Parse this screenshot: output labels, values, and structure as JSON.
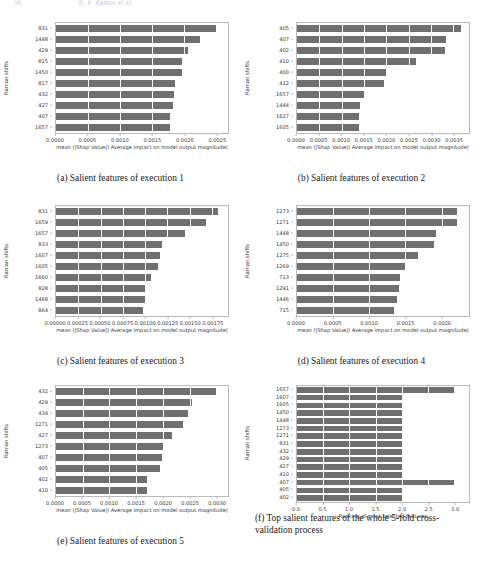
{
  "header": {
    "page_number": "56",
    "running_head": "A. F. Ramos et al."
  },
  "figure": {
    "panels": [
      {
        "id": "a",
        "caption": "(a) Salient features of execution 1",
        "ylabel": "Raman shifts",
        "xlabel": "mean (|Shap Value|) Average impact on model output magnitude)",
        "chart_data": {
          "type": "bar",
          "orientation": "horizontal",
          "title": "",
          "ylabel": "Raman shifts",
          "xlabel": "mean (|Shap Value|) Average impact on model output magnitude)",
          "categories": [
            "831",
            "1448",
            "429",
            "815",
            "1450",
            "817",
            "432",
            "427",
            "407",
            "1657"
          ],
          "values": [
            0.00249,
            0.00225,
            0.00205,
            0.00197,
            0.00196,
            0.00185,
            0.00184,
            0.00182,
            0.00178,
            0.00177
          ],
          "xlim": [
            0,
            0.00268
          ],
          "xticks": [
            0.0,
            0.0005,
            0.001,
            0.0015,
            0.002,
            0.0025
          ],
          "xticklabels": [
            "0.0000",
            "0.0005",
            "0.0010",
            "0.0015",
            "0.0020",
            "0.0025"
          ],
          "grid": true,
          "legend": null
        }
      },
      {
        "id": "b",
        "caption": "(b) Salient features of execution 2",
        "ylabel": "Raman shifts",
        "xlabel": "mean (|Shap Value|) Average impact on model output magnitude)",
        "chart_data": {
          "type": "bar",
          "orientation": "horizontal",
          "title": "",
          "ylabel": "Raman shifts",
          "xlabel": "mean (|Shap Value|) Average impact on model output magnitude)",
          "categories": [
            "405",
            "407",
            "402",
            "410",
            "400",
            "412",
            "1657",
            "1444",
            "1627",
            "1605"
          ],
          "values": [
            0.00366,
            0.00334,
            0.00331,
            0.00266,
            0.00201,
            0.00194,
            0.00152,
            0.0014,
            0.00139,
            0.00138
          ],
          "xlim": [
            0,
            0.00385
          ],
          "xticks": [
            0.0,
            0.0005,
            0.001,
            0.0015,
            0.002,
            0.0025,
            0.003,
            0.0035
          ],
          "xticklabels": [
            "0.0000",
            "0.0005",
            "0.0010",
            "0.0015",
            "0.0020",
            "0.0025",
            "0.0030",
            "0.0035"
          ],
          "grid": true,
          "legend": null
        }
      },
      {
        "id": "c",
        "caption": "(c) Salient features of execution 3",
        "ylabel": "Raman shifts",
        "xlabel": "mean (|Shap Value|) Average impact on model output magnitude)",
        "chart_data": {
          "type": "bar",
          "orientation": "horizontal",
          "title": "",
          "ylabel": "Raman shifts",
          "xlabel": "mean (|Shap Value|) Average impact on model output magnitude)",
          "categories": [
            "831",
            "1659",
            "1657",
            "833",
            "1607",
            "1605",
            "1660",
            "828",
            "1468",
            "864"
          ],
          "values": [
            0.00182,
            0.00168,
            0.00145,
            0.00119,
            0.00117,
            0.00114,
            0.00107,
            0.00101,
            0.001,
            0.00098
          ],
          "xlim": [
            0,
            0.00193
          ],
          "xticks": [
            0.0,
            0.00025,
            0.0005,
            0.00075,
            0.001,
            0.00125,
            0.0015,
            0.00175
          ],
          "xticklabels": [
            "0.00000",
            "0.00025",
            "0.00050",
            "0.00075",
            "0.00100",
            "0.00125",
            "0.00150",
            "0.00175"
          ],
          "grid": true,
          "legend": null
        }
      },
      {
        "id": "d",
        "caption": "(d) Salient features of execution 4",
        "ylabel": "Raman shifts",
        "xlabel": "mean (|Shap Value|) Average impact on model output magnitude)",
        "chart_data": {
          "type": "bar",
          "orientation": "horizontal",
          "title": "",
          "ylabel": "Raman shifts",
          "xlabel": "mean (|Shap Value|) Average impact on model output magnitude)",
          "categories": [
            "1273",
            "1271",
            "1448",
            "1450",
            "1275",
            "1269",
            "713",
            "1291",
            "1446",
            "715"
          ],
          "values": [
            0.00222,
            0.00221,
            0.00193,
            0.0019,
            0.00168,
            0.0015,
            0.00142,
            0.00141,
            0.00139,
            0.00134
          ],
          "xlim": [
            0,
            0.00238
          ],
          "xticks": [
            0.0,
            0.0005,
            0.001,
            0.0015,
            0.002
          ],
          "xticklabels": [
            "0.0000",
            "0.0005",
            "0.0010",
            "0.0015",
            "0.0020"
          ],
          "grid": true,
          "legend": null
        }
      },
      {
        "id": "e",
        "caption": "(e) Salient features of execution 5",
        "ylabel": "Raman shifts",
        "xlabel": "mean (|Shap Value|) Average impact on model output magnitude)",
        "chart_data": {
          "type": "bar",
          "orientation": "horizontal",
          "title": "",
          "ylabel": "Raman shifts",
          "xlabel": "mean (|Shap Value|) Average impact on model output magnitude)",
          "categories": [
            "432",
            "429",
            "434",
            "1271",
            "427",
            "1273",
            "407",
            "405",
            "402",
            "410"
          ],
          "values": [
            0.00299,
            0.00255,
            0.00248,
            0.00237,
            0.00218,
            0.002,
            0.00199,
            0.00194,
            0.00171,
            0.0017
          ],
          "xlim": [
            0,
            0.00322
          ],
          "xticks": [
            0.0,
            0.0005,
            0.001,
            0.0015,
            0.002,
            0.0025,
            0.003
          ],
          "xticklabels": [
            "0.0000",
            "0.0005",
            "0.0010",
            "0.0015",
            "0.0020",
            "0.0025",
            "0.0030"
          ],
          "grid": true,
          "legend": null
        }
      },
      {
        "id": "f",
        "caption": "(f) Top salient features of the whole 5-fold cross-validation process",
        "ylabel": "Raman shifts",
        "xlabel": "Ranking of most selected features",
        "chart_data": {
          "type": "bar",
          "orientation": "horizontal",
          "title": "",
          "ylabel": "Raman shifts",
          "xlabel": "Ranking of most selected features",
          "categories": [
            "1657",
            "1607",
            "1605",
            "1450",
            "1448",
            "1273",
            "1271",
            "831",
            "432",
            "429",
            "427",
            "410",
            "407",
            "405",
            "402"
          ],
          "values": [
            3,
            2,
            2,
            2,
            2,
            2,
            2,
            2,
            2,
            2,
            2,
            2,
            3,
            2,
            2
          ],
          "xlim": [
            0,
            3.28
          ],
          "xticks": [
            0.0,
            0.5,
            1.0,
            1.5,
            2.0,
            2.5,
            3.0
          ],
          "xticklabels": [
            "0.0",
            "0.5",
            "1.0",
            "1.5",
            "2.0",
            "2.5",
            "3.0"
          ],
          "grid": true,
          "legend": null
        }
      }
    ]
  },
  "colors": {
    "bar": "#6f6f6f",
    "axis": "#b9b9b9",
    "text": "#3a3a3a"
  }
}
